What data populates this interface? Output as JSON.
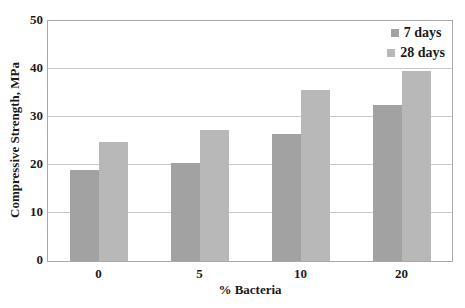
{
  "chart_data": {
    "type": "bar",
    "title": "",
    "xlabel": "% Bacteria",
    "ylabel": "Compressive Strength, MPa",
    "categories": [
      "0",
      "5",
      "10",
      "20"
    ],
    "series": [
      {
        "name": "7 days",
        "color": "#a2a2a2",
        "values": [
          19.0,
          20.5,
          26.5,
          32.4
        ]
      },
      {
        "name": "28 days",
        "color": "#b8b8b8",
        "values": [
          24.7,
          27.3,
          35.7,
          39.5
        ]
      }
    ],
    "ylim": [
      0,
      50
    ],
    "yticks": [
      0,
      10,
      20,
      30,
      40,
      50
    ],
    "grid": "horizontal",
    "legend_position": "top-right-inside"
  },
  "colors": {
    "grid": "#c9c9c9",
    "plot_border": "#a9a9a9",
    "text": "#1b1b1b",
    "background": "#ffffff"
  }
}
